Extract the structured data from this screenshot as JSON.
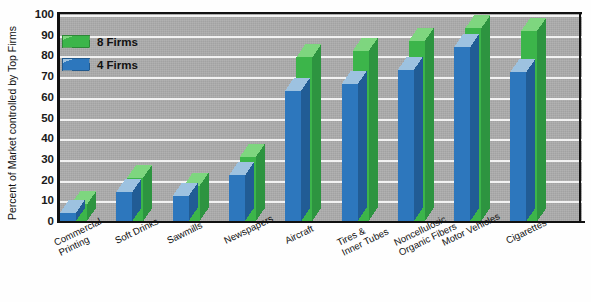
{
  "chart": {
    "type": "bar",
    "title": "",
    "ylabel": "Percent of Market controlled by Top Firms",
    "xlabel": "",
    "ylim": [
      0,
      100
    ],
    "ytick_step": 10,
    "grid": true,
    "style": "3d-grouped-columns",
    "legend_position": "top-left-inside"
  },
  "chart_data": {
    "type": "bar",
    "title": "",
    "xlabel": "",
    "ylabel": "Percent of Market controlled by Top Firms",
    "ylim": [
      0,
      100
    ],
    "yticks": [
      0,
      10,
      20,
      30,
      40,
      50,
      60,
      70,
      80,
      90,
      100
    ],
    "grid": true,
    "legend": [
      "8 Firms",
      "4 Firms"
    ],
    "legend_position": "upper left (inside plot area)",
    "categories": [
      "Commercial Printing",
      "Soft Drinks",
      "Sawmills",
      "Newspapers",
      "Aircraft",
      "Tires & Inner Tubes",
      "Noncellulosic Organic Fibers",
      "Motor Vehicles",
      "Cigarettes"
    ],
    "series": [
      {
        "name": "8 Firms",
        "color": "#3cb54a",
        "values": [
          8,
          21,
          17,
          31,
          79,
          82,
          87,
          93,
          92
        ]
      },
      {
        "name": "4 Firms",
        "color": "#2d77bd",
        "values": [
          4,
          14,
          12,
          22,
          63,
          66,
          73,
          84,
          72
        ]
      }
    ]
  },
  "ytick_labels": [
    "100",
    "90",
    "80",
    "70",
    "60",
    "50",
    "40",
    "30",
    "20",
    "10",
    "0"
  ],
  "legend": {
    "items": [
      {
        "label": "8 Firms",
        "color": "#3cb54a"
      },
      {
        "label": "4 Firms",
        "color": "#2d77bd"
      }
    ]
  },
  "categories": [
    {
      "line1": "Commercial",
      "line2": "Printing"
    },
    {
      "line1": "Soft Drinks",
      "line2": ""
    },
    {
      "line1": "Sawmills",
      "line2": ""
    },
    {
      "line1": "Newspapers",
      "line2": ""
    },
    {
      "line1": "Aircraft",
      "line2": ""
    },
    {
      "line1": "Tires &",
      "line2": "Inner Tubes"
    },
    {
      "line1": "Noncellulosic",
      "line2": "Organic Fibers"
    },
    {
      "line1": "Motor Vehicles",
      "line2": ""
    },
    {
      "line1": "Cigarettes",
      "line2": ""
    }
  ],
  "colors": {
    "green_face": "#3cb54a",
    "green_top": "#7ed67f",
    "green_side": "#2d9440",
    "blue_face": "#2d77bd",
    "blue_top": "#9dc2e0",
    "blue_side": "#215c95",
    "panel": "#adadad",
    "gridline": "#f2f2f2",
    "axis": "#111111",
    "background": "#ffffff"
  },
  "caption": ""
}
